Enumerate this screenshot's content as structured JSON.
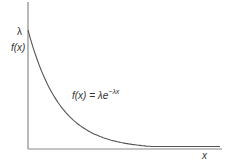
{
  "chart_data": {
    "type": "line",
    "title": "",
    "xlabel": "x",
    "ylabel": "f(x)",
    "y_marker_label": "λ",
    "annotation": {
      "text_prefix": "f(x) = λe",
      "exponent": "−λx",
      "position": "mid-curve"
    },
    "series": [
      {
        "name": "f(x) = λe^(−λx)",
        "x": [
          0,
          0.5,
          1,
          1.5,
          2,
          2.5,
          3,
          3.5,
          4,
          4.5,
          5,
          5.5,
          6
        ],
        "values": [
          1.0,
          0.61,
          0.37,
          0.22,
          0.14,
          0.08,
          0.05,
          0.03,
          0.02,
          0.01,
          0.007,
          0.004,
          0.002
        ]
      }
    ],
    "xlim": [
      0,
      6
    ],
    "ylim": [
      0,
      1.0
    ],
    "grid": false,
    "legend": "none",
    "ticks": "none",
    "colors": {
      "axis": "#888888",
      "curve": "#555555",
      "text": "#333333"
    }
  },
  "labels": {
    "lambda": "λ",
    "fx": "f(x)",
    "x_axis": "x",
    "formula_base": "f(x) = λe",
    "formula_exp": "−λx"
  }
}
